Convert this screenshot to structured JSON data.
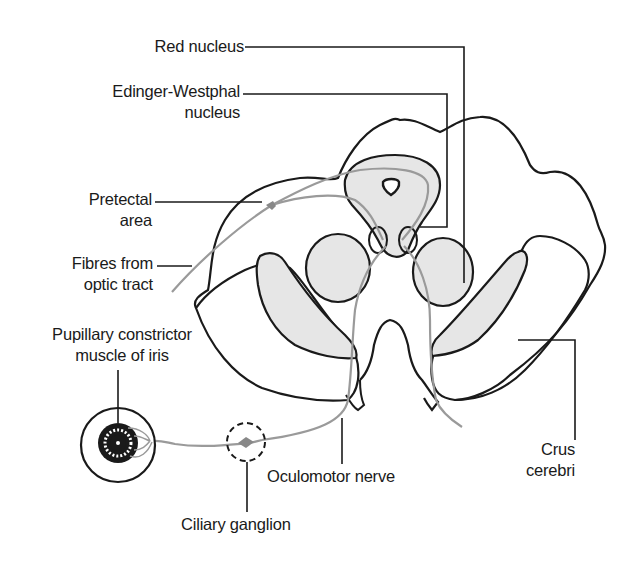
{
  "diagram": {
    "colors": {
      "outline": "#1a1a1a",
      "fill_shaded": "#e6e6e6",
      "fibre_path": "#9a9a9a",
      "background": "#ffffff"
    },
    "labels": {
      "red_nucleus": "Red nucleus",
      "edinger_westphal_line1": "Edinger-Westphal",
      "edinger_westphal_line2": "nucleus",
      "pretectal_line1": "Pretectal",
      "pretectal_line2": "area",
      "optic_tract_line1": "Fibres from",
      "optic_tract_line2": "optic tract",
      "pupillary_line1": "Pupillary constrictor",
      "pupillary_line2": "muscle of iris",
      "oculomotor_nerve": "Oculomotor nerve",
      "ciliary_ganglion": "Ciliary ganglion",
      "crus_line1": "Crus",
      "crus_line2": "cerebri"
    },
    "icons": {
      "eye": "eye-iris-icon",
      "ganglion": "ciliary-ganglion-dashed-circle"
    }
  }
}
